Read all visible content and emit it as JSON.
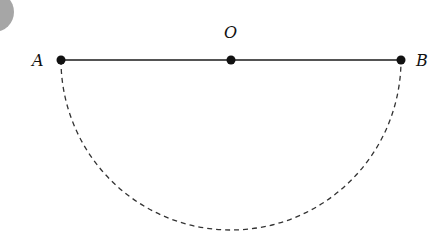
{
  "diagram": {
    "labels": {
      "a": "A",
      "o": "O",
      "b": "B"
    },
    "points": {
      "A": {
        "x": 61,
        "y": 60
      },
      "O": {
        "x": 231,
        "y": 60
      },
      "B": {
        "x": 401,
        "y": 60
      }
    },
    "segment": "AB",
    "arc": {
      "type": "semicircle",
      "center": "O",
      "style": "dashed",
      "side": "below"
    },
    "colors": {
      "line": "#1a1a1a",
      "arc": "#333333",
      "badge": "#a6a6a6"
    }
  }
}
